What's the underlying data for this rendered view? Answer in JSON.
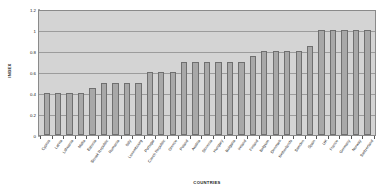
{
  "chart_data": {
    "type": "bar",
    "title": "",
    "xlabel": "COUNTRIES",
    "ylabel": "INDEX",
    "ylim": [
      0,
      1.2
    ],
    "yticks": [
      0,
      0.2,
      0.4,
      0.6,
      0.8,
      1,
      1.2
    ],
    "ytick_labels": [
      "0",
      "0.2",
      "0.4",
      "0.6",
      "0.8",
      "1",
      "1.2"
    ],
    "grid": true,
    "legend": "none",
    "categories": [
      "Cyprus",
      "Latvia",
      "Lithuania",
      "Malta",
      "Estonia",
      "Slovak Republic",
      "Romania",
      "Italy",
      "Luxembourg",
      "Portugal",
      "Czech Republic",
      "Greece",
      "Poland",
      "Austria",
      "Slovenia",
      "Hungary",
      "Bulgaria",
      "Ireland",
      "Finland",
      "Belgium",
      "Denmark",
      "Netherlands",
      "Sweden",
      "Spain",
      "UK",
      "France",
      "Germany",
      "Norway",
      "Switzerland"
    ],
    "values": [
      0.4,
      0.4,
      0.4,
      0.4,
      0.45,
      0.5,
      0.5,
      0.5,
      0.5,
      0.6,
      0.6,
      0.6,
      0.7,
      0.7,
      0.7,
      0.7,
      0.7,
      0.7,
      0.75,
      0.8,
      0.8,
      0.8,
      0.8,
      0.85,
      1.0,
      1.0,
      1.0,
      1.0,
      1.0
    ],
    "colors": {
      "bar_fill": "#a8a8a8",
      "bar_border": "#6f6f6f",
      "plot_background": "#d4d4d4",
      "gridline": "#9c9c9c",
      "plot_border": "#8a8a8a",
      "page_background": "#ffffff",
      "text": "#1a1a1a"
    }
  }
}
